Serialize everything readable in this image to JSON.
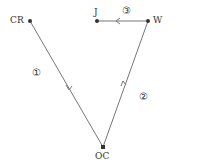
{
  "nodes": {
    "cr": {
      "label": "CR"
    },
    "j": {
      "label": "J"
    },
    "w": {
      "label": "W"
    },
    "oc": {
      "label": "OC"
    }
  },
  "edges": {
    "e1": {
      "label": "①",
      "from": "CR",
      "to": "OC"
    },
    "e2": {
      "label": "②",
      "from": "OC",
      "to": "W"
    },
    "e3": {
      "label": "③",
      "from": "W",
      "to": "J"
    }
  },
  "colors": {
    "line": "#777777",
    "node": "#333333",
    "text": "#333333"
  }
}
